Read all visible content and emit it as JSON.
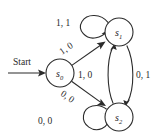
{
  "diagram": {
    "type": "finite-state-machine",
    "start_label": "Start",
    "states": [
      {
        "id": "s0",
        "base": "s",
        "sub": "0",
        "cx": 60,
        "cy": 73,
        "r": 14
      },
      {
        "id": "s1",
        "base": "s",
        "sub": "1",
        "cx": 119,
        "cy": 32,
        "r": 14
      },
      {
        "id": "s2",
        "base": "s",
        "sub": "2",
        "cx": 119,
        "cy": 117,
        "r": 14
      }
    ],
    "transitions": [
      {
        "id": "t_s1_self",
        "from": "s1",
        "to": "s1",
        "label": "1, 1"
      },
      {
        "id": "t_s0_s1",
        "from": "s0",
        "to": "s1",
        "label": "1, 0"
      },
      {
        "id": "t_s0_s2",
        "from": "s0",
        "to": "s2",
        "label": "0, 0"
      },
      {
        "id": "t_s2_s1",
        "from": "s2",
        "to": "s1",
        "label": "1, 0"
      },
      {
        "id": "t_s1_s2",
        "from": "s1",
        "to": "s2",
        "label": "0, 1"
      },
      {
        "id": "t_s2_self",
        "from": "s2",
        "to": "s2",
        "label": "0, 0"
      }
    ],
    "labels": {
      "loop_s1": "1, 1",
      "diag_up": "1, 0",
      "diag_down": "0, 0",
      "middle": "1, 0",
      "right": "0, 1",
      "loop_s2": "0, 0"
    },
    "colors": {
      "stroke": "#2b2b2b",
      "text": "#1a1a1a",
      "background": "#ffffff"
    }
  }
}
